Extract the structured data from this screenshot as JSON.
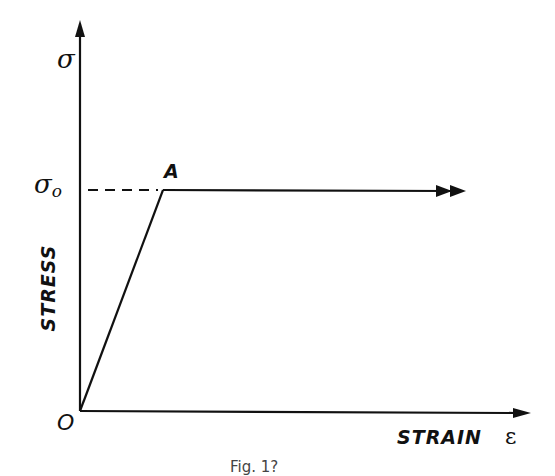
{
  "diagram": {
    "type": "stress-strain (elastic–perfectly plastic)",
    "y_axis": {
      "symbol": "σ",
      "label": "STRESS"
    },
    "x_axis": {
      "symbol": "ε",
      "label": "STRAIN"
    },
    "origin_label": "O",
    "yield_stress_label": "σ",
    "yield_stress_subscript": "o",
    "point_label": "A",
    "caption": "Fig. 1?",
    "colors": {
      "ink": "#111111",
      "background": "#ffffff"
    }
  }
}
